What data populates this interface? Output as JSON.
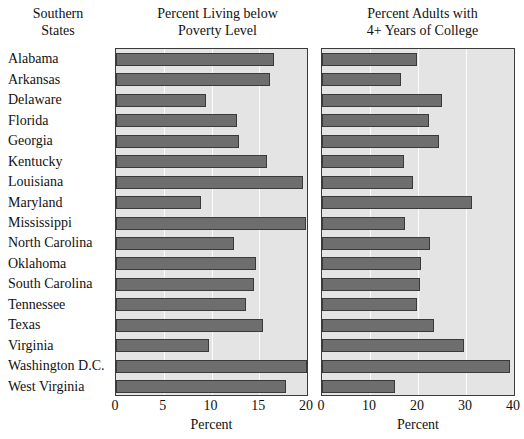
{
  "headers": {
    "states": "Southern\nStates",
    "states_line1": "Southern",
    "states_line2": "States",
    "left_line1": "Percent Living below",
    "left_line2": "Poverty Level",
    "right_line1": "Percent Adults with",
    "right_line2": "4+ Years of College"
  },
  "axis": {
    "left_label": "Percent",
    "right_label": "Percent",
    "left_ticks": [
      "0",
      "5",
      "10",
      "15",
      "20"
    ],
    "right_ticks": [
      "0",
      "10",
      "20",
      "30",
      "40"
    ]
  },
  "colors": {
    "bar_fill": "#6e6e6e",
    "bar_edge": "#3a3a3a",
    "panel_bg": "#e4e4e4",
    "panel_edge": "#3b3b3b",
    "gridline": "#fbfbfb",
    "page_bg": "#ffffff",
    "text": "#111111"
  },
  "chart_data": [
    {
      "type": "bar",
      "orientation": "horizontal",
      "title": "Percent Living below Poverty Level",
      "xlabel": "Percent",
      "ylabel": "Southern States",
      "xlim": [
        0,
        20
      ],
      "xticks": [
        0,
        5,
        10,
        15,
        20
      ],
      "grid": true,
      "legend": "none",
      "categories": [
        "Alabama",
        "Arkansas",
        "Delaware",
        "Florida",
        "Georgia",
        "Kentucky",
        "Louisiana",
        "Maryland",
        "Mississippi",
        "North Carolina",
        "Oklahoma",
        "South Carolina",
        "Tennessee",
        "Texas",
        "Virginia",
        "Washington D.C.",
        "West Virginia"
      ],
      "values": [
        16.5,
        16.1,
        9.4,
        12.7,
        12.9,
        15.8,
        19.6,
        8.9,
        19.9,
        12.4,
        14.7,
        14.4,
        13.6,
        15.4,
        9.7,
        20.0,
        17.8
      ]
    },
    {
      "type": "bar",
      "orientation": "horizontal",
      "title": "Percent Adults with 4+ Years of College",
      "xlabel": "Percent",
      "ylabel": "Southern States",
      "xlim": [
        0,
        40
      ],
      "xticks": [
        0,
        10,
        20,
        30,
        40
      ],
      "grid": true,
      "legend": "none",
      "categories": [
        "Alabama",
        "Arkansas",
        "Delaware",
        "Florida",
        "Georgia",
        "Kentucky",
        "Louisiana",
        "Maryland",
        "Mississippi",
        "North Carolina",
        "Oklahoma",
        "South Carolina",
        "Tennessee",
        "Texas",
        "Virginia",
        "Washington D.C.",
        "West Virginia"
      ],
      "values": [
        19.8,
        16.5,
        25.0,
        22.3,
        24.3,
        17.1,
        19.0,
        31.2,
        17.3,
        22.5,
        20.6,
        20.4,
        19.8,
        23.3,
        29.6,
        39.1,
        15.3
      ]
    }
  ]
}
